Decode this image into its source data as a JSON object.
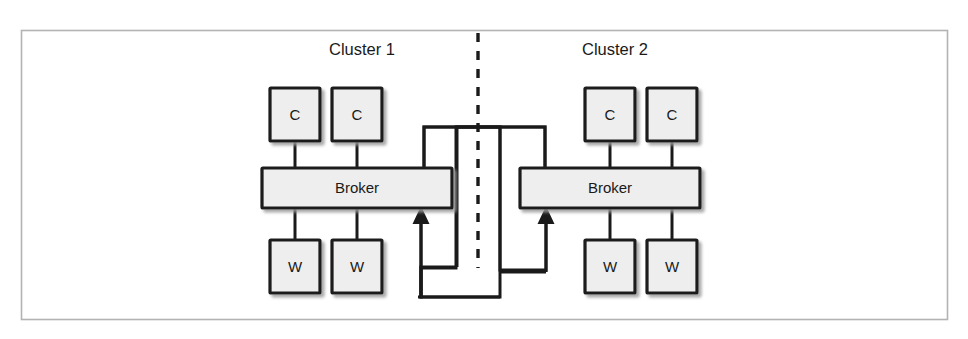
{
  "figure": {
    "name": "zeromq-broker-cluster-bridge-diagram",
    "frame": {
      "stroke": "#b3b3b3"
    },
    "colors": {
      "node_fill": "#eeeeee",
      "node_stroke": "#1a1a1a",
      "line": "#1a1a1a",
      "divider": "#1a1a1a",
      "frame": "#b3b3b3",
      "text": "#1a1a1a"
    },
    "clusters": [
      {
        "id": "cluster-1",
        "title": "Cluster 1",
        "clients": [
          {
            "id": "c1-client-1",
            "label": "C"
          },
          {
            "id": "c1-client-2",
            "label": "C"
          }
        ],
        "broker": {
          "id": "c1-broker",
          "label": "Broker"
        },
        "workers": [
          {
            "id": "c1-worker-1",
            "label": "W"
          },
          {
            "id": "c1-worker-2",
            "label": "W"
          }
        ]
      },
      {
        "id": "cluster-2",
        "title": "Cluster 2",
        "clients": [
          {
            "id": "c2-client-1",
            "label": "C"
          },
          {
            "id": "c2-client-2",
            "label": "C"
          }
        ],
        "broker": {
          "id": "c2-broker",
          "label": "Broker"
        },
        "workers": [
          {
            "id": "c2-worker-1",
            "label": "W"
          },
          {
            "id": "c2-worker-2",
            "label": "W"
          }
        ]
      }
    ],
    "divider": {
      "id": "cluster-divider",
      "style": "dashed",
      "orientation": "vertical"
    },
    "bridges": [
      {
        "id": "bridge-c1-to-c2",
        "from": "c1-broker",
        "to": "c2-broker",
        "arrow": "to-cluster-2-broker"
      },
      {
        "id": "bridge-c2-to-c1",
        "from": "c2-broker",
        "to": "c1-broker",
        "arrow": "to-cluster-1-broker"
      }
    ]
  }
}
